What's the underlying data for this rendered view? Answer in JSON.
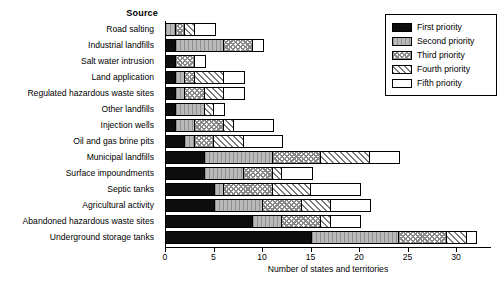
{
  "chart_data": {
    "type": "bar",
    "orientation": "horizontal",
    "stacked": true,
    "title": "",
    "ylabel": "Source",
    "xlabel": "Number of states and territories",
    "xlim": [
      0,
      33.6
    ],
    "xticks": [
      0,
      5,
      10,
      15,
      20,
      25,
      30
    ],
    "xtick_labels": [
      "0",
      "5",
      "10",
      "15",
      "20",
      "25",
      "30"
    ],
    "grid": false,
    "legend_position": "top-right",
    "categories": [
      "Road salting",
      "Industrial landfills",
      "Salt water intrusion",
      "Land application",
      "Regulated hazardous waste sites",
      "Other landfills",
      "Injection wells",
      "Oil and gas brine pits",
      "Municipal landfills",
      "Surface impoundments",
      "Septic tanks",
      "Agricultural activity",
      "Abandoned hazardous waste sites",
      "Underground storage tanks"
    ],
    "series": [
      {
        "name": "First priority",
        "pattern": "solid-black",
        "color": "#0d0d0d",
        "values": [
          0,
          1,
          1,
          1,
          1,
          1,
          1,
          2,
          4,
          4,
          5,
          5,
          9,
          15
        ]
      },
      {
        "name": "Second priority",
        "pattern": "light-gray",
        "color": "#b9b9b9",
        "values": [
          1,
          5,
          0,
          1,
          1,
          3,
          2,
          1,
          7,
          4,
          1,
          5,
          3,
          9
        ]
      },
      {
        "name": "Third priority",
        "pattern": "dotted",
        "color": "#ffffff",
        "values": [
          1,
          3,
          2,
          1,
          2,
          0,
          3,
          2,
          5,
          3,
          5,
          4,
          4,
          5
        ]
      },
      {
        "name": "Fourth priority",
        "pattern": "diagonal-hatch",
        "color": "#ffffff",
        "values": [
          1,
          0,
          0,
          3,
          2,
          1,
          1,
          3,
          5,
          1,
          4,
          3,
          1,
          2
        ]
      },
      {
        "name": "Fifth priority",
        "pattern": "white",
        "color": "#ffffff",
        "values": [
          2,
          1,
          1,
          2,
          2,
          1,
          4,
          4,
          3,
          3,
          5,
          4,
          3,
          1
        ]
      }
    ],
    "totals": [
      5,
      10,
      4,
      8,
      8,
      6,
      11,
      12,
      24,
      15,
      20,
      21,
      20,
      32
    ]
  }
}
